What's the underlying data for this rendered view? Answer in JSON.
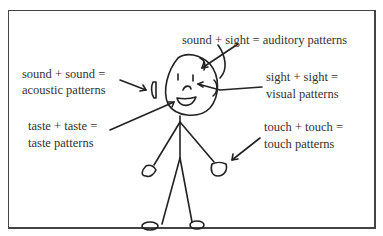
{
  "diagram": {
    "labels": {
      "auditory": "sound + sight = auditory patterns",
      "acoustic_line1": "sound + sound =",
      "acoustic_line2": "acoustic patterns",
      "visual_line1": "sight + sight =",
      "visual_line2": "visual patterns",
      "taste_line1": "taste + taste =",
      "taste_line2": "taste patterns",
      "touch_line1": "touch + touch =",
      "touch_line2": "touch patterns"
    },
    "figure": "stick-figure",
    "colors": {
      "ink": "#222222",
      "text": "#333333",
      "border": "#444444",
      "background": "#ffffff"
    }
  }
}
